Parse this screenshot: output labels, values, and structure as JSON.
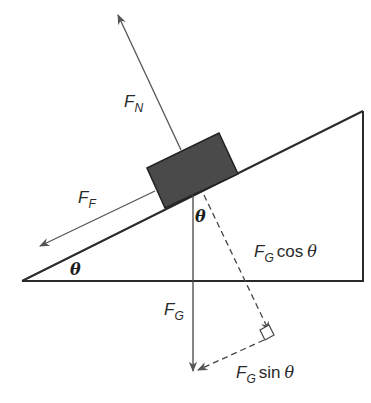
{
  "diagram": {
    "colors": {
      "line": "#2a2a2a",
      "arrow": "#555555",
      "block_fill": "#4a4a4a",
      "background": "#ffffff"
    },
    "labels": {
      "normal_force": {
        "main": "F",
        "sub": "N"
      },
      "friction_force": {
        "main": "F",
        "sub": "F"
      },
      "gravity_force": {
        "main": "F",
        "sub": "G"
      },
      "cos_component": {
        "main": "F",
        "sub": "G",
        "rest": "cos",
        "symbol": "θ"
      },
      "sin_component": {
        "main": "F",
        "sub": "G",
        "rest": "sin",
        "symbol": "θ"
      },
      "incline_angle": "θ",
      "block_angle": "θ"
    }
  }
}
